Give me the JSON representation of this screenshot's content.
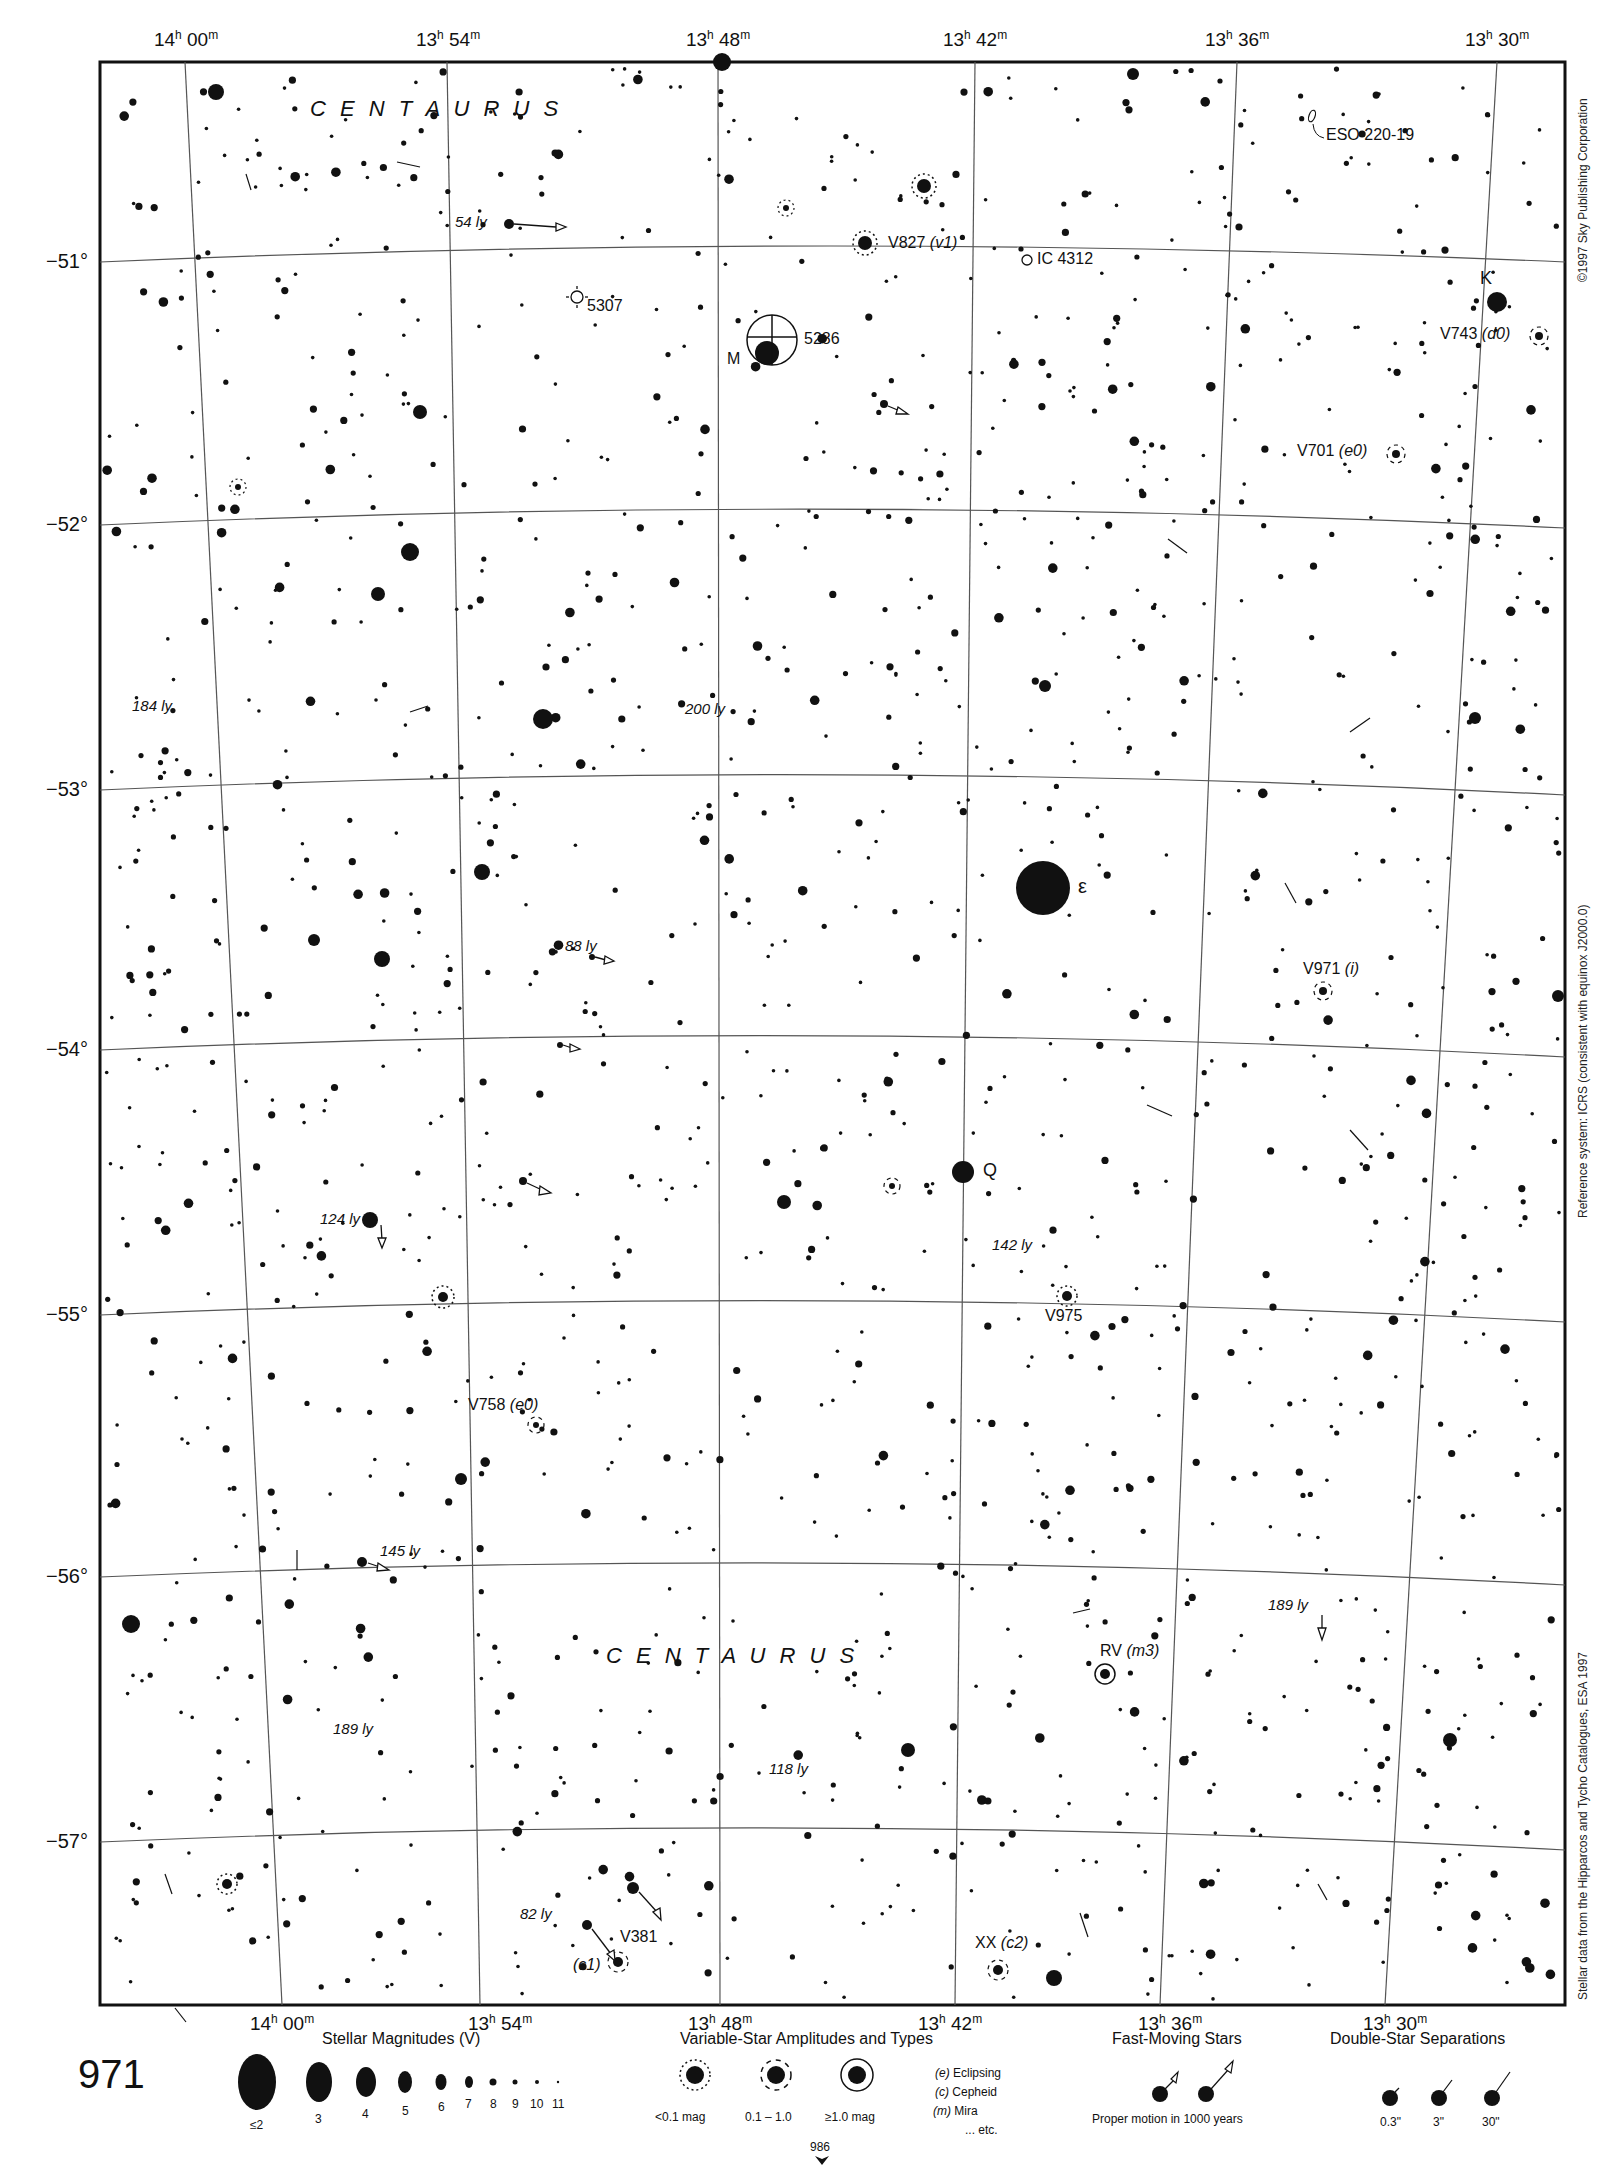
{
  "chart": {
    "page_number": "971",
    "next_page_ref": "986",
    "constellation": "CENTAURUS",
    "copyright": "©1997 Sky Publishing Corporation",
    "reference_system": "Reference system: ICRS (consistent with equinox J2000.0)",
    "data_source": "Stellar data from the Hipparcos and Tycho Catalogues, ESA 1997",
    "ra_labels": [
      "14h 00m",
      "13h 54m",
      "13h 48m",
      "13h 42m",
      "13h 36m",
      "13h 30m"
    ],
    "dec_labels": [
      "−51°",
      "−52°",
      "−53°",
      "−54°",
      "−55°",
      "−56°",
      "−57°"
    ]
  },
  "labels": {
    "centaurus_top": "C E N T A U R U S",
    "centaurus_bottom": "C E N T A U R U S",
    "eso": "ESO 220-19",
    "ic4312": "IC 4312",
    "ngc5307": "5307",
    "ngc5286": "5286",
    "m_star": "M",
    "k_star": "K",
    "epsilon": "ε",
    "q_star": "Q",
    "v827": "V827",
    "v827_type": "(v1)",
    "v743": "V743",
    "v743_type": "(d0)",
    "v701": "V701",
    "v701_type": "(e0)",
    "v971": "V971",
    "v971_type": "(i)",
    "v975": "V975",
    "v758": "V758",
    "v758_type": "(e0)",
    "rv": "RV",
    "rv_type": "(m3)",
    "v381": "V381",
    "v381_type": "(c1)",
    "xx": "XX",
    "xx_type": "(c2)",
    "ly_54": "54 ly",
    "ly_184": "184 ly",
    "ly_200": "200 ly",
    "ly_88": "88 ly",
    "ly_124": "124 ly",
    "ly_142": "142 ly",
    "ly_145": "145 ly",
    "ly_189a": "189 ly",
    "ly_189b": "189 ly",
    "ly_118": "118 ly",
    "ly_82": "82 ly"
  },
  "legend": {
    "magnitudes": {
      "title": "Stellar Magnitudes (V)",
      "items": [
        "≤2",
        "3",
        "4",
        "5",
        "6",
        "7",
        "8",
        "9",
        "10",
        "11"
      ]
    },
    "variables": {
      "title": "Variable-Star Amplitudes and Types",
      "amplitudes": [
        "<0.1 mag",
        "0.1 – 1.0",
        "≥1.0 mag"
      ],
      "types": [
        {
          "code": "(e)",
          "name": "Eclipsing"
        },
        {
          "code": "(c)",
          "name": "Cepheid"
        },
        {
          "code": "(m)",
          "name": "Mira"
        },
        {
          "code": "",
          "name": "... etc."
        }
      ]
    },
    "fast_moving": {
      "title": "Fast-Moving Stars",
      "caption": "Proper motion in 1000 years"
    },
    "doubles": {
      "title": "Double-Star Separations",
      "items": [
        "0.3\"",
        "3\"",
        "30\""
      ]
    }
  },
  "colors": {
    "ink": "#111111",
    "grid": "#555555",
    "paper": "#ffffff"
  }
}
